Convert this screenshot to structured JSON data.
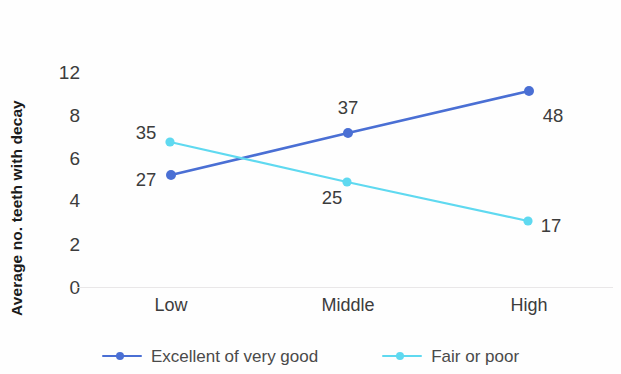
{
  "chart_data": {
    "type": "line",
    "title": "",
    "xlabel": "",
    "ylabel": "Average no. teeth  with decay",
    "categories": [
      "Low",
      "Middle",
      "High"
    ],
    "ytick_labels": [
      "12",
      "8",
      "6",
      "4",
      "2",
      "0"
    ],
    "ytick_positions": [
      72,
      115,
      158,
      200,
      244,
      287
    ],
    "ylim": [
      0,
      12
    ],
    "grid": false,
    "legend_position": "bottom",
    "series": [
      {
        "name": "Excellent of very good",
        "color": "#4a6fd4",
        "values": [
          5.2,
          7.3,
          10.6
        ],
        "point_labels": [
          "27",
          "37",
          "48"
        ],
        "points_px": [
          [
            171,
            175
          ],
          [
            348,
            133
          ],
          [
            529,
            91
          ]
        ],
        "label_px": [
          [
            146,
            180
          ],
          [
            348,
            108
          ],
          [
            553,
            116
          ]
        ]
      },
      {
        "name": "Fair or poor",
        "color": "#5fd9f0",
        "values": [
          6.9,
          4.9,
          3.2
        ],
        "point_labels": [
          "35",
          "25",
          "17"
        ],
        "points_px": [
          [
            170,
            142
          ],
          [
            347,
            182
          ],
          [
            528,
            221
          ]
        ],
        "label_px": [
          [
            146,
            133
          ],
          [
            332,
            198
          ],
          [
            551,
            226
          ]
        ]
      }
    ],
    "xtick_positions_px": [
      171,
      348,
      529
    ],
    "baseline_y_px": 287,
    "colors": {
      "series_blue": "#4a6fd4",
      "series_cyan": "#5fd9f0",
      "text": "#3c3c3c",
      "axis_line": "#e9e7e8",
      "background": "#fefefe"
    }
  }
}
